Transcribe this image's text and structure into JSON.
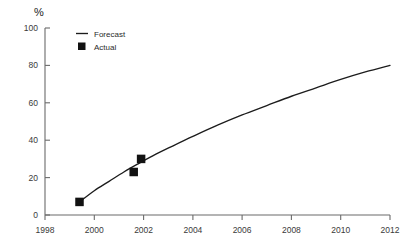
{
  "chart_data": {
    "type": "line",
    "title": "",
    "subtitle": "",
    "xlabel": "",
    "ylabel": "%",
    "xlim": [
      1998,
      2012
    ],
    "ylim": [
      0,
      100
    ],
    "grid": false,
    "legend_position": "top-left-inside",
    "x_ticks": [
      "1998",
      "2000",
      "2002",
      "2004",
      "2006",
      "2008",
      "2010",
      "2012"
    ],
    "x_tick_values": [
      1998,
      2000,
      2002,
      2004,
      2006,
      2008,
      2010,
      2012
    ],
    "y_ticks": [
      "0",
      "20",
      "40",
      "60",
      "80",
      "100"
    ],
    "y_tick_values": [
      0,
      20,
      40,
      60,
      80,
      100
    ],
    "series": [
      {
        "name": "Forecast",
        "type": "line",
        "color": "#1c1c1c",
        "x": [
          1999.4,
          2000.0,
          2000.6,
          2001.2,
          2001.8,
          2002.5,
          2003.2,
          2004.0,
          2005.0,
          2006.0,
          2007.0,
          2008.0,
          2009.0,
          2010.0,
          2011.0,
          2012.0
        ],
        "values": [
          7,
          13,
          18,
          23,
          27.5,
          32.5,
          37,
          42,
          48,
          53.5,
          58.5,
          63.5,
          68,
          72.5,
          76.5,
          80
        ]
      },
      {
        "name": "Actual",
        "type": "scatter",
        "color": "#121212",
        "marker": "filled-square",
        "x": [
          1999.4,
          2001.6,
          2001.9
        ],
        "values": [
          7,
          23,
          30
        ]
      }
    ],
    "legend": [
      {
        "label": "Forecast",
        "marker": "line",
        "color": "#1c1c1c"
      },
      {
        "label": "Actual",
        "marker": "filled-square",
        "color": "#121212"
      }
    ]
  },
  "axes": {
    "y_unit_label": "%"
  }
}
